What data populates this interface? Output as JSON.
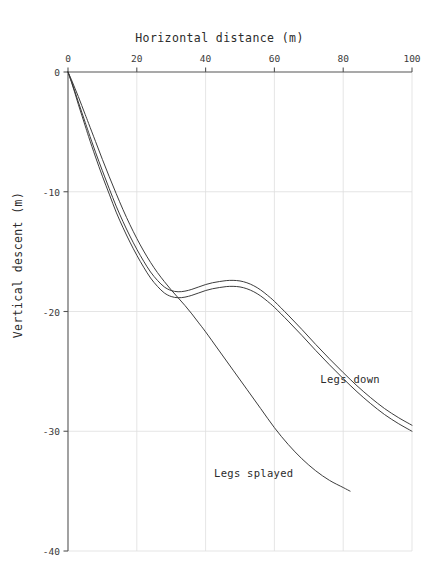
{
  "chart_data": {
    "type": "line",
    "title": "",
    "xlabel": "Horizontal distance (m)",
    "ylabel": "Vertical descent (m)",
    "xlim": [
      0,
      100
    ],
    "ylim": [
      -40,
      0
    ],
    "xticks": [
      0,
      20,
      40,
      60,
      80,
      100
    ],
    "yticks": [
      0,
      -10,
      -20,
      -30,
      -40
    ],
    "xtick_labels": [
      "0",
      "20",
      "40",
      "60",
      "80",
      "100"
    ],
    "ytick_labels": [
      "0",
      "-10",
      "-20",
      "-30",
      "-40"
    ],
    "x_axis_position": "top",
    "grid": true,
    "grid_color": "#dedede",
    "axis_color": "#555555",
    "line_color": "#333333",
    "legend": "inline-annotation",
    "annotations": [
      {
        "text": "Legs down",
        "x": 82,
        "y": -25.6
      },
      {
        "text": "Legs splayed",
        "x": 54,
        "y": -33.5
      }
    ],
    "series": [
      {
        "name": "Legs down",
        "label": "Legs down",
        "x": [
          0,
          1,
          2,
          3,
          4,
          5,
          6,
          8,
          10,
          12,
          14,
          16,
          18,
          20,
          22,
          24,
          26,
          28,
          30,
          32,
          34,
          36,
          38,
          40,
          42,
          44,
          46,
          48,
          50,
          52,
          54,
          56,
          58,
          60,
          64,
          68,
          72,
          76,
          80,
          84,
          88,
          92,
          96,
          100
        ],
        "y": [
          0,
          -0.85,
          -1.75,
          -2.7,
          -3.6,
          -4.5,
          -5.4,
          -7.1,
          -8.7,
          -10.2,
          -11.7,
          -13.0,
          -14.2,
          -15.3,
          -16.3,
          -17.2,
          -17.9,
          -18.45,
          -18.75,
          -18.85,
          -18.8,
          -18.65,
          -18.45,
          -18.25,
          -18.1,
          -18.0,
          -17.92,
          -17.9,
          -17.95,
          -18.1,
          -18.35,
          -18.7,
          -19.15,
          -19.65,
          -20.8,
          -22.0,
          -23.25,
          -24.45,
          -25.6,
          -26.7,
          -27.7,
          -28.6,
          -29.35,
          -30.0
        ]
      },
      {
        "name": "Legs down (inner)",
        "label": "Legs down",
        "x": [
          0,
          1,
          2,
          3,
          4,
          5,
          6,
          8,
          10,
          12,
          14,
          16,
          18,
          20,
          22,
          24,
          26,
          28,
          30,
          32,
          34,
          36,
          38,
          40,
          42,
          44,
          46,
          48,
          50,
          52,
          54,
          56,
          58,
          60,
          64,
          68,
          72,
          76,
          80,
          84,
          88,
          92,
          96,
          100
        ],
        "y": [
          0,
          -0.78,
          -1.62,
          -2.5,
          -3.35,
          -4.2,
          -5.05,
          -6.7,
          -8.25,
          -9.75,
          -11.2,
          -12.5,
          -13.7,
          -14.8,
          -15.8,
          -16.7,
          -17.4,
          -17.95,
          -18.25,
          -18.35,
          -18.3,
          -18.15,
          -17.95,
          -17.75,
          -17.6,
          -17.5,
          -17.42,
          -17.4,
          -17.45,
          -17.6,
          -17.85,
          -18.2,
          -18.65,
          -19.15,
          -20.3,
          -21.5,
          -22.75,
          -23.95,
          -25.1,
          -26.2,
          -27.2,
          -28.1,
          -28.85,
          -29.5
        ]
      },
      {
        "name": "Legs splayed",
        "label": "Legs splayed",
        "x": [
          0,
          1,
          2,
          3,
          4,
          5,
          6,
          8,
          10,
          12,
          14,
          16,
          18,
          20,
          22,
          24,
          26,
          28,
          30,
          32,
          34,
          36,
          38,
          40,
          44,
          48,
          52,
          56,
          60,
          64,
          68,
          72,
          76,
          80,
          82
        ],
        "y": [
          0,
          -0.65,
          -1.35,
          -2.05,
          -2.8,
          -3.55,
          -4.3,
          -5.8,
          -7.3,
          -8.75,
          -10.15,
          -11.5,
          -12.75,
          -13.9,
          -14.95,
          -15.9,
          -16.75,
          -17.5,
          -18.2,
          -18.85,
          -19.5,
          -20.2,
          -20.95,
          -21.7,
          -23.3,
          -24.9,
          -26.5,
          -28.1,
          -29.7,
          -31.1,
          -32.3,
          -33.3,
          -34.1,
          -34.7,
          -35.0
        ]
      }
    ]
  }
}
